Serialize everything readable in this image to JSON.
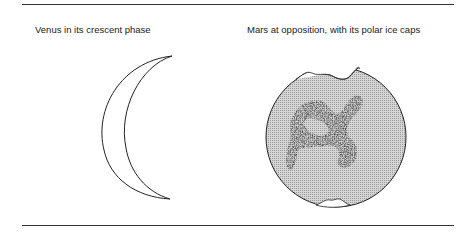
{
  "figure": {
    "panels": [
      {
        "caption": "Venus in its crescent phase",
        "subject": "venus-crescent"
      },
      {
        "caption": "Mars at opposition, with its polar ice caps",
        "subject": "mars-opposition"
      }
    ],
    "colors": {
      "line": "#222222",
      "mars_fill": "#c8c8c8",
      "dark_markings": "#333333",
      "ice_cap": "#ffffff"
    }
  }
}
